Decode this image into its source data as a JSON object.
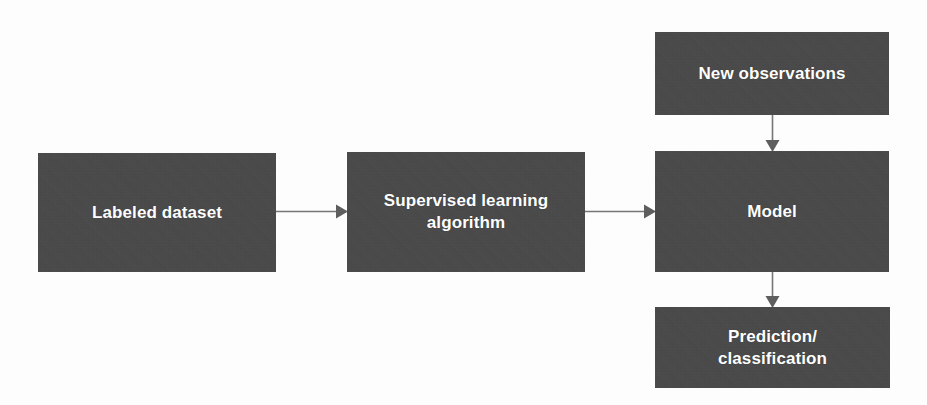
{
  "diagram": {
    "type": "flowchart",
    "canvas": {
      "width": 927,
      "height": 405
    },
    "colors": {
      "background": "#fdfdfd",
      "node_fill": "#474747",
      "node_text": "#ffffff",
      "connector": "#767676",
      "arrowhead": "#5e5e5e"
    },
    "nodes": [
      {
        "id": "labeled-dataset",
        "label": "Labeled dataset",
        "x": 38,
        "y": 153,
        "width": 238,
        "height": 119
      },
      {
        "id": "supervised-algorithm",
        "label": "Supervised learning\nalgorithm",
        "x": 347,
        "y": 152,
        "width": 238,
        "height": 120
      },
      {
        "id": "new-observations",
        "label": "New observations",
        "x": 655,
        "y": 32,
        "width": 234,
        "height": 83
      },
      {
        "id": "model",
        "label": "Model",
        "x": 655,
        "y": 151,
        "width": 234,
        "height": 121
      },
      {
        "id": "prediction-classification",
        "label": "Prediction/\nclassification",
        "x": 655,
        "y": 307,
        "width": 235,
        "height": 81
      }
    ],
    "connectors": [
      {
        "id": "labeled-dataset-to-supervised-algorithm",
        "from": "labeled-dataset",
        "to": "supervised-algorithm",
        "direction": "right",
        "label": ""
      },
      {
        "id": "supervised-algorithm-to-model",
        "from": "supervised-algorithm",
        "to": "model",
        "direction": "right",
        "label": ""
      },
      {
        "id": "new-observations-to-model",
        "from": "new-observations",
        "to": "model",
        "direction": "down",
        "label": ""
      },
      {
        "id": "model-to-prediction-classification",
        "from": "model",
        "to": "prediction-classification",
        "direction": "down",
        "label": ""
      }
    ]
  }
}
